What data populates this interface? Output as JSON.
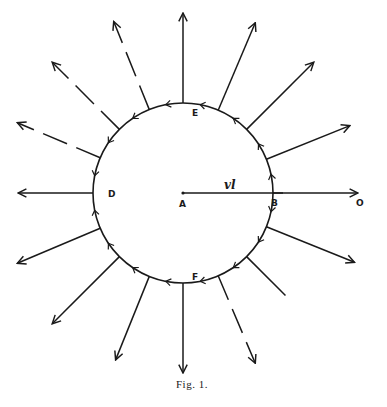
{
  "figure": {
    "caption": "Fig. 1.",
    "labels": {
      "center": "A",
      "right_point": "B",
      "left_point": "D",
      "top_point": "E",
      "bottom_point": "F",
      "outer_point": "O",
      "radius_label": "vl"
    },
    "radial_arrows_count": 16,
    "stroke_color": "#1a1a1a"
  }
}
